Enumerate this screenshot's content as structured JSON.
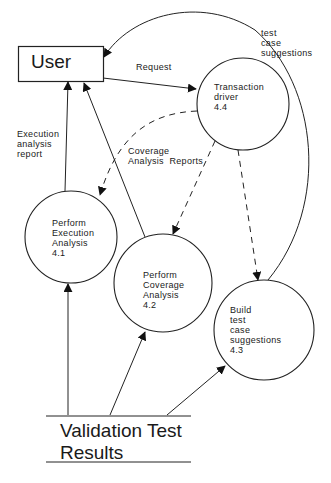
{
  "diagram": {
    "type": "data-flow-diagram",
    "entities": [
      {
        "id": "user",
        "label": "User"
      }
    ],
    "processes": [
      {
        "id": "4.4",
        "lines": [
          "Transaction",
          "driver",
          "4.4"
        ]
      },
      {
        "id": "4.1",
        "lines": [
          "Perform",
          "Execution",
          "Analysis",
          "4.1"
        ]
      },
      {
        "id": "4.2",
        "lines": [
          "Perform",
          "Coverage",
          "Analysis",
          "4.2"
        ]
      },
      {
        "id": "4.3",
        "lines": [
          "Build",
          "test",
          "case",
          "suggestions",
          "4.3"
        ]
      }
    ],
    "data_stores": [
      {
        "id": "vtr",
        "lines": [
          "Validation Test",
          "Results"
        ]
      }
    ],
    "flows": [
      {
        "from": "user",
        "to": "4.4",
        "label": "Request",
        "style": "solid"
      },
      {
        "from": "4.3",
        "to": "user",
        "label": "test\ncase\nsuggestions",
        "style": "solid"
      },
      {
        "from": "4.1",
        "to": "user",
        "label": "Execution\nanalysis\nreport",
        "style": "solid"
      },
      {
        "from": "4.2",
        "to": "user",
        "label": "",
        "style": "solid"
      },
      {
        "from": "4.4",
        "to": "4.1",
        "label": "Coverage\nAnalysis Reports",
        "style": "dashed"
      },
      {
        "from": "4.4",
        "to": "4.2",
        "label": "",
        "style": "dashed"
      },
      {
        "from": "4.4",
        "to": "4.3",
        "label": "",
        "style": "dashed"
      },
      {
        "from": "vtr",
        "to": "4.1",
        "label": "",
        "style": "solid"
      },
      {
        "from": "vtr",
        "to": "4.2",
        "label": "",
        "style": "solid"
      },
      {
        "from": "vtr",
        "to": "4.3",
        "label": "",
        "style": "solid"
      }
    ]
  },
  "labels": {
    "user": "User",
    "request": "Request",
    "test_case_suggestions": "test\ncase\nsuggestions",
    "execution_analysis_report": "Execution\nanalysis\nreport",
    "coverage_analysis_reports": "Coverage\nAnalysis  Reports",
    "p44": "Transaction\ndriver\n4.4",
    "p41": "Perform\nExecution\nAnalysis\n4.1",
    "p42": "Perform\nCoverage\nAnalysis\n4.2",
    "p43": "Build\ntest\ncase\nsuggestions\n4.3",
    "store": "Validation Test\nResults"
  }
}
